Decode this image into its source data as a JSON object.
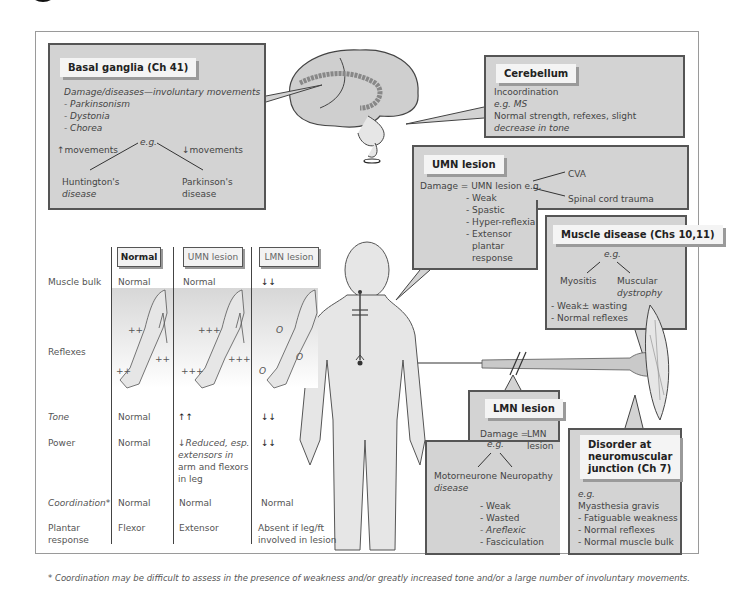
{
  "basal_ganglia": {
    "title": "Basal ganglia (Ch 41)",
    "line1": "Damage/diseases—involuntary movements",
    "items": [
      "- Parkinsonism",
      "- Dystonia",
      "- Chorea"
    ],
    "eg": "e.g.",
    "left_label": "↑movements",
    "right_label": "↓movements",
    "left_example_1": "Huntington's",
    "left_example_2": "disease",
    "right_example_1": "Parkinson's",
    "right_example_2": "disease"
  },
  "cerebellum": {
    "title": "Cerebellum",
    "lines": [
      "Incoordination",
      "e.g. MS",
      "Normal strength, refexes, slight",
      "decrease in tone"
    ]
  },
  "umn_lesion": {
    "title": "UMN lesion",
    "damage": "Damage = UMN lesion e.g.",
    "cause_1": "CVA",
    "cause_2": "Spinal cord trauma",
    "signs": [
      "- Weak",
      "- Spastic",
      "- Hyper-reflexia",
      "- Extensor",
      "plantar",
      "response"
    ]
  },
  "muscle_disease": {
    "title": "Muscle disease (Chs 10,11)",
    "eg": "e.g.",
    "left": "Myositis",
    "right_1": "Muscular",
    "right_2": "dystrophy",
    "signs": [
      "- Weak± wasting",
      "- Normal reflexes"
    ]
  },
  "lmn_lesion": {
    "title": "LMN lesion",
    "damage_1": "Damage =",
    "damage_2": "e.g.",
    "lmn_1": "LMN",
    "lmn_2": "lesion",
    "left_1": "Motorneurone",
    "left_2": "disease",
    "right": "Neuropathy",
    "signs": [
      "- Weak",
      "- Wasted",
      "- Areflexic",
      "- Fasciculation"
    ]
  },
  "nmj": {
    "title_1": "Disorder at",
    "title_2": "neuromuscular",
    "title_3": "junction (Ch 7)",
    "eg": "e.g.",
    "lines": [
      "Myasthesia gravis",
      "- Fatiguable weakness",
      "- Normal reflexes",
      "- Normal muscle bulk"
    ]
  },
  "table": {
    "columns": [
      "Normal",
      "UMN lesion",
      "LMN lesion"
    ],
    "rows": [
      {
        "label": "Muscle bulk",
        "normal": "Normal",
        "umn": "Normal",
        "lmn": "↓↓"
      },
      {
        "label": "Reflexes",
        "normal": "",
        "umn": "",
        "lmn": ""
      },
      {
        "label": "Tone",
        "normal": "Normal",
        "umn": "↑↑",
        "lmn": "↓↓"
      },
      {
        "label": "Power",
        "normal": "Normal",
        "umn": "↓Reduced, esp.",
        "lmn": "↓↓"
      },
      {
        "label": "Coordination*",
        "normal": "Normal",
        "umn": "Normal",
        "lmn": "Normal"
      },
      {
        "label": "Plantar",
        "normal": "Flexor",
        "umn": "Extensor",
        "lmn": "Absent if leg/ft"
      }
    ],
    "power_umn_extra": [
      "extensors in",
      "arm and flexors",
      "in leg"
    ],
    "plantar_label_2": "response",
    "plantar_lmn_2": "involved in lesion",
    "reflex_marks": {
      "normal": [
        "++",
        "++",
        "++"
      ],
      "umn": [
        "+++",
        "+++",
        "+++"
      ],
      "lmn": [
        "O",
        "O",
        "O"
      ]
    }
  },
  "footnote": "* Coordination may be difficult to assess in the presence of weakness and/or greatly increased tone and/or a large number of involuntary movements.",
  "colors": {
    "box_fill": "#d3d3d3",
    "box_border": "#555555",
    "tab_fill": "#f4f4f4",
    "figure_fill": "#e6e6e6"
  }
}
